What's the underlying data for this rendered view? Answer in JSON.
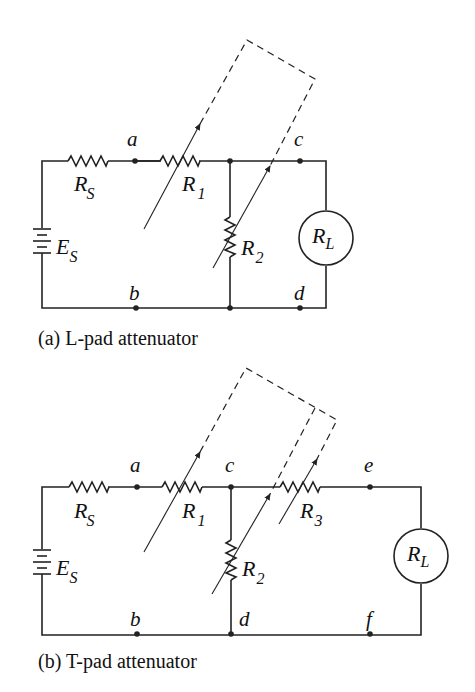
{
  "figure": {
    "a": {
      "caption": "(a) L-pad attenuator",
      "nodes": [
        "a",
        "b",
        "c",
        "d"
      ],
      "components": {
        "source": {
          "label": "E",
          "sub": "S"
        },
        "rs": {
          "label": "R",
          "sub": "S"
        },
        "r1": {
          "label": "R",
          "sub": "1"
        },
        "r2": {
          "label": "R",
          "sub": "2"
        },
        "rl": {
          "label": "R",
          "sub": "L"
        }
      }
    },
    "b": {
      "caption": "(b) T-pad attenuator",
      "nodes": [
        "a",
        "b",
        "c",
        "d",
        "e",
        "f"
      ],
      "components": {
        "source": {
          "label": "E",
          "sub": "S"
        },
        "rs": {
          "label": "R",
          "sub": "S"
        },
        "r1": {
          "label": "R",
          "sub": "1"
        },
        "r2": {
          "label": "R",
          "sub": "2"
        },
        "r3": {
          "label": "R",
          "sub": "3"
        },
        "rl": {
          "label": "R",
          "sub": "L"
        }
      }
    }
  }
}
